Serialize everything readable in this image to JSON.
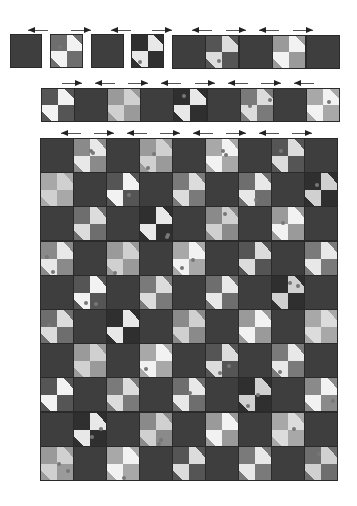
{
  "diagram": {
    "title": "",
    "colors": {
      "dark_block": "#3e3e3e",
      "border": "#2a2a2a",
      "arrow": "#222222",
      "background": "#ffffff"
    },
    "fabrics": {
      "light": [
        "#e8e8e8",
        "#dcdcdc",
        "#f2f2f2",
        "#d0d0d0"
      ],
      "tie": [
        "#8a8a8a",
        "#6e6e6e",
        "#555555",
        "#9a9a9a",
        "#2f2f2f",
        "#7a7a7a",
        "#a8a8a8"
      ]
    }
  },
  "step1": {
    "separate_blocks": [
      {
        "type": "dark",
        "x": 10,
        "y": 34,
        "w": 32,
        "h": 34
      },
      {
        "type": "bowtie",
        "x": 50,
        "y": 34,
        "w": 33,
        "h": 34,
        "tie": 1,
        "light": 2
      },
      {
        "type": "dark",
        "x": 91,
        "y": 34,
        "w": 33,
        "h": 34
      },
      {
        "type": "bowtie",
        "x": 131,
        "y": 34,
        "w": 33,
        "h": 34,
        "tie": 4,
        "light": 0
      }
    ],
    "joined_strip": {
      "x": 172,
      "y": 35,
      "w": 167,
      "h": 34,
      "blocks": [
        "dark",
        "bowtie",
        "dark",
        "bowtie",
        "dark"
      ]
    },
    "arrows": [
      "left",
      "right",
      "left",
      "right",
      "left",
      "right",
      "left",
      "right"
    ]
  },
  "step2": {
    "strip": {
      "x": 41,
      "y": 88,
      "w": 298,
      "h": 34,
      "blocks": [
        "bowtie",
        "dark",
        "bowtie",
        "dark",
        "bowtie",
        "dark",
        "bowtie",
        "dark",
        "bowtie"
      ]
    },
    "arrows": [
      "right",
      "left",
      "right",
      "left",
      "right",
      "left",
      "right",
      "left"
    ]
  },
  "step3": {
    "grid": {
      "x": 40,
      "y": 138,
      "w": 297,
      "h": 342,
      "cols": 9,
      "rows": 10,
      "first_row_starts_with": "dark"
    },
    "arrows": [
      "left",
      "right",
      "left",
      "right",
      "left",
      "right",
      "left",
      "right"
    ]
  }
}
